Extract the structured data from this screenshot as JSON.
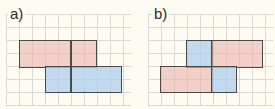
{
  "figures": [
    {
      "label": "a)",
      "shapes": [
        {
          "color": "pink",
          "x": 19,
          "y": 40,
          "w": 78,
          "h": 27
        },
        {
          "color": "blue",
          "x": 45,
          "y": 67,
          "w": 77,
          "h": 26
        }
      ],
      "divider_x": 71
    },
    {
      "label": "b)",
      "shapes": [
        {
          "color": "blue",
          "x": 186,
          "y": 40,
          "w": 26,
          "h": 27
        },
        {
          "color": "pink",
          "x": 212,
          "y": 40,
          "w": 51,
          "h": 27
        },
        {
          "color": "pink",
          "x": 160,
          "y": 67,
          "w": 52,
          "h": 26
        },
        {
          "color": "blue",
          "x": 212,
          "y": 67,
          "w": 25,
          "h": 26
        }
      ]
    }
  ],
  "colors": {
    "pink": "#ecb4aa",
    "blue": "#afcdeb",
    "grid": "#d8d8d8",
    "background": "#fdfbf2"
  }
}
